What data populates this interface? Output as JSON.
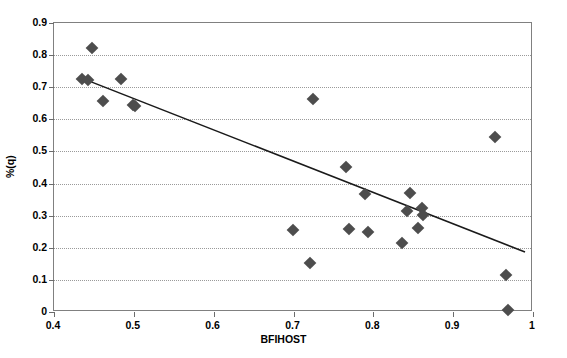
{
  "chart_data": {
    "type": "scatter",
    "title": "",
    "xlabel": "BFIHOST",
    "ylabel": "%(q)",
    "xlim": [
      0.4,
      1.0
    ],
    "ylim": [
      0.0,
      0.9
    ],
    "grid": true,
    "grid_axis": "y",
    "legend": null,
    "xticks": [
      0.4,
      0.5,
      0.6,
      0.7,
      0.8,
      0.9,
      1
    ],
    "xticklabels": [
      "0.4",
      "0.5",
      "0.6",
      "0.7",
      "0.8",
      "0.9",
      "1"
    ],
    "yticks": [
      0,
      0.1,
      0.2,
      0.3,
      0.4,
      0.5,
      0.6,
      0.7,
      0.8,
      0.9
    ],
    "yticklabels": [
      "0",
      "0.1",
      "0.2",
      "0.3",
      "0.4",
      "0.5",
      "0.6",
      "0.7",
      "0.8",
      "0.9"
    ],
    "marker": "diamond",
    "marker_color": "#4d4d4d",
    "points": [
      {
        "x": 0.435,
        "y": 0.727
      },
      {
        "x": 0.442,
        "y": 0.723
      },
      {
        "x": 0.447,
        "y": 0.822
      },
      {
        "x": 0.462,
        "y": 0.658
      },
      {
        "x": 0.484,
        "y": 0.725
      },
      {
        "x": 0.499,
        "y": 0.646
      },
      {
        "x": 0.502,
        "y": 0.641
      },
      {
        "x": 0.699,
        "y": 0.256
      },
      {
        "x": 0.721,
        "y": 0.152
      },
      {
        "x": 0.724,
        "y": 0.662
      },
      {
        "x": 0.766,
        "y": 0.453
      },
      {
        "x": 0.769,
        "y": 0.258
      },
      {
        "x": 0.789,
        "y": 0.366
      },
      {
        "x": 0.793,
        "y": 0.25
      },
      {
        "x": 0.836,
        "y": 0.215
      },
      {
        "x": 0.842,
        "y": 0.316
      },
      {
        "x": 0.846,
        "y": 0.371
      },
      {
        "x": 0.856,
        "y": 0.262
      },
      {
        "x": 0.861,
        "y": 0.323
      },
      {
        "x": 0.862,
        "y": 0.303
      },
      {
        "x": 0.952,
        "y": 0.546
      },
      {
        "x": 0.966,
        "y": 0.115
      },
      {
        "x": 0.969,
        "y": 0.006
      }
    ],
    "trendline": {
      "type": "linear",
      "x_start": 0.437,
      "y_start": 0.726,
      "x_end": 0.99,
      "y_end": 0.187
    }
  }
}
